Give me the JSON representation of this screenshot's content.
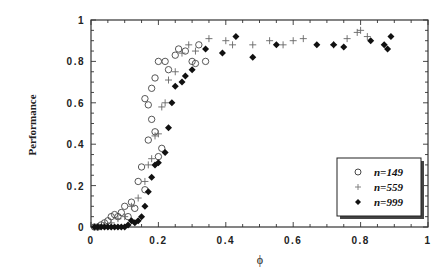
{
  "chart_data": {
    "type": "scatter",
    "title": "",
    "xlabel": "ϕ",
    "ylabel": "Performance",
    "xlim": [
      0,
      1
    ],
    "ylim": [
      0,
      1
    ],
    "x_ticks": [
      "0",
      "0.2",
      "0.4",
      "0.6",
      "0.8",
      "1"
    ],
    "y_ticks": [
      "0",
      "0.2",
      "0.4",
      "0.6",
      "0.8",
      "1"
    ],
    "grid": false,
    "legend_position": "lower right",
    "series": [
      {
        "name": "n=149",
        "marker": "open-circle",
        "points": [
          [
            0.01,
            0.0
          ],
          [
            0.02,
            0.0
          ],
          [
            0.03,
            0.01
          ],
          [
            0.04,
            0.02
          ],
          [
            0.05,
            0.03
          ],
          [
            0.06,
            0.05
          ],
          [
            0.07,
            0.06
          ],
          [
            0.08,
            0.05
          ],
          [
            0.09,
            0.07
          ],
          [
            0.1,
            0.1
          ],
          [
            0.11,
            0.05
          ],
          [
            0.12,
            0.12
          ],
          [
            0.13,
            0.09
          ],
          [
            0.14,
            0.22
          ],
          [
            0.15,
            0.29
          ],
          [
            0.16,
            0.18
          ],
          [
            0.17,
            0.42
          ],
          [
            0.18,
            0.52
          ],
          [
            0.19,
            0.46
          ],
          [
            0.2,
            0.34
          ],
          [
            0.21,
            0.38
          ],
          [
            0.16,
            0.62
          ],
          [
            0.17,
            0.59
          ],
          [
            0.18,
            0.67
          ],
          [
            0.19,
            0.72
          ],
          [
            0.2,
            0.8
          ],
          [
            0.22,
            0.8
          ],
          [
            0.23,
            0.76
          ],
          [
            0.25,
            0.83
          ],
          [
            0.26,
            0.86
          ],
          [
            0.28,
            0.85
          ],
          [
            0.3,
            0.8
          ],
          [
            0.31,
            0.79
          ],
          [
            0.32,
            0.88
          ],
          [
            0.34,
            0.8
          ]
        ]
      },
      {
        "name": "n=559",
        "marker": "plus",
        "points": [
          [
            0.02,
            0.0
          ],
          [
            0.04,
            0.01
          ],
          [
            0.06,
            0.02
          ],
          [
            0.08,
            0.04
          ],
          [
            0.1,
            0.05
          ],
          [
            0.12,
            0.1
          ],
          [
            0.14,
            0.14
          ],
          [
            0.16,
            0.22
          ],
          [
            0.17,
            0.3
          ],
          [
            0.18,
            0.33
          ],
          [
            0.19,
            0.44
          ],
          [
            0.2,
            0.45
          ],
          [
            0.21,
            0.58
          ],
          [
            0.22,
            0.6
          ],
          [
            0.23,
            0.71
          ],
          [
            0.25,
            0.75
          ],
          [
            0.27,
            0.84
          ],
          [
            0.29,
            0.88
          ],
          [
            0.31,
            0.85
          ],
          [
            0.35,
            0.91
          ],
          [
            0.4,
            0.9
          ],
          [
            0.42,
            0.88
          ],
          [
            0.48,
            0.88
          ],
          [
            0.53,
            0.9
          ],
          [
            0.57,
            0.88
          ],
          [
            0.6,
            0.9
          ],
          [
            0.63,
            0.91
          ],
          [
            0.72,
            0.88
          ],
          [
            0.76,
            0.91
          ],
          [
            0.79,
            0.94
          ],
          [
            0.8,
            0.95
          ],
          [
            0.82,
            0.92
          ]
        ]
      },
      {
        "name": "n=999",
        "marker": "filled-diamond",
        "points": [
          [
            0.01,
            0.0
          ],
          [
            0.02,
            0.0
          ],
          [
            0.03,
            0.0
          ],
          [
            0.04,
            0.0
          ],
          [
            0.05,
            0.0
          ],
          [
            0.06,
            0.0
          ],
          [
            0.07,
            0.0
          ],
          [
            0.08,
            0.0
          ],
          [
            0.09,
            0.0
          ],
          [
            0.1,
            0.0
          ],
          [
            0.11,
            0.01
          ],
          [
            0.12,
            0.03
          ],
          [
            0.13,
            0.02
          ],
          [
            0.14,
            0.03
          ],
          [
            0.15,
            0.05
          ],
          [
            0.16,
            0.1
          ],
          [
            0.17,
            0.17
          ],
          [
            0.18,
            0.24
          ],
          [
            0.19,
            0.3
          ],
          [
            0.2,
            0.31
          ],
          [
            0.22,
            0.36
          ],
          [
            0.23,
            0.48
          ],
          [
            0.24,
            0.6
          ],
          [
            0.25,
            0.68
          ],
          [
            0.27,
            0.7
          ],
          [
            0.28,
            0.73
          ],
          [
            0.3,
            0.76
          ],
          [
            0.34,
            0.86
          ],
          [
            0.39,
            0.84
          ],
          [
            0.43,
            0.92
          ],
          [
            0.48,
            0.82
          ],
          [
            0.55,
            0.88
          ],
          [
            0.67,
            0.88
          ],
          [
            0.72,
            0.88
          ],
          [
            0.75,
            0.87
          ],
          [
            0.83,
            0.9
          ],
          [
            0.87,
            0.88
          ],
          [
            0.88,
            0.86
          ],
          [
            0.89,
            0.92
          ]
        ]
      }
    ]
  },
  "legend": {
    "items": [
      {
        "label": "n=149"
      },
      {
        "label": "n=559"
      },
      {
        "label": "n=999"
      }
    ]
  },
  "axes": {
    "xlabel": "ϕ",
    "ylabel": "Performance",
    "x_ticks": [
      "0",
      "0.2",
      "0.4",
      "0.6",
      "0.8",
      "1"
    ],
    "y_ticks": [
      "0",
      "0.2",
      "0.4",
      "0.6",
      "0.8",
      "1"
    ]
  }
}
